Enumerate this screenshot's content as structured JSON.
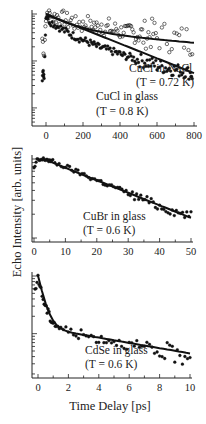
{
  "figure": {
    "ylabel": "Echo Intensity [arb. units]",
    "xlabel": "Time Delay [ps]"
  },
  "chart_data": [
    {
      "type": "scatter",
      "yscale": "log",
      "xlim": [
        -30,
        800
      ],
      "xticks": [
        0,
        200,
        400,
        600,
        800
      ],
      "xtick_labels": [
        "0",
        "200",
        "400",
        "600",
        "800"
      ],
      "grid": false,
      "annotations": [
        {
          "text": "CuCl in NaCl",
          "line2": "(T = 0.72 K)"
        },
        {
          "text": "CuCl in glass",
          "line2": "(T = 0.8 K)"
        }
      ],
      "series": [
        {
          "name": "CuCl in NaCl (T = 0.72 K)",
          "marker": "open-circle",
          "x": [
            -20,
            -10,
            0,
            10,
            20,
            40,
            60,
            80,
            100,
            120,
            140,
            160,
            180,
            200,
            220,
            240,
            260,
            280,
            300,
            320,
            340,
            360,
            380,
            400,
            420,
            440,
            460,
            480,
            500,
            520,
            540,
            560,
            580,
            600,
            640,
            680,
            720,
            760,
            790
          ],
          "y_rel": [
            0.3,
            0.16,
            1.0,
            0.98,
            0.92,
            0.85,
            0.9,
            0.75,
            0.82,
            0.68,
            0.72,
            0.6,
            0.65,
            0.55,
            0.7,
            0.52,
            0.6,
            0.5,
            0.62,
            0.45,
            0.55,
            0.42,
            0.5,
            0.4,
            0.48,
            0.38,
            0.45,
            0.36,
            0.42,
            0.33,
            0.38,
            0.35,
            0.4,
            0.32,
            0.34,
            0.3,
            0.28,
            0.29,
            0.26
          ]
        },
        {
          "name": "CuCl in glass (T = 0.8 K)",
          "marker": "filled-circle",
          "x": [
            -20,
            -15,
            -10,
            0,
            10,
            20,
            40,
            60,
            80,
            100,
            120,
            140,
            160,
            180,
            200,
            220,
            240,
            260,
            280,
            300,
            320,
            340,
            360,
            380,
            400,
            420,
            440,
            460,
            480,
            500,
            520,
            540,
            560,
            580,
            600,
            620,
            640,
            660,
            680,
            700,
            720,
            740,
            760,
            780,
            790
          ],
          "y_rel": [
            0.045,
            0.055,
            0.05,
            0.95,
            0.85,
            0.7,
            0.62,
            0.55,
            0.5,
            0.44,
            0.4,
            0.36,
            0.33,
            0.3,
            0.28,
            0.26,
            0.24,
            0.22,
            0.2,
            0.19,
            0.18,
            0.17,
            0.16,
            0.15,
            0.14,
            0.13,
            0.125,
            0.12,
            0.11,
            0.105,
            0.1,
            0.095,
            0.09,
            0.085,
            0.08,
            0.077,
            0.073,
            0.07,
            0.067,
            0.065,
            0.062,
            0.06,
            0.058,
            0.055,
            0.05
          ]
        }
      ],
      "fits": [
        {
          "name": "CuCl in NaCl fit",
          "x": [
            0,
            800
          ],
          "y_rel_start": 1.0,
          "y_rel_end": 0.26
        },
        {
          "name": "CuCl in glass fit",
          "x": [
            0,
            800
          ],
          "y_rel_start": 1.0,
          "y_rel_end": 0.055
        }
      ]
    },
    {
      "type": "scatter",
      "yscale": "log",
      "xlim": [
        0,
        50
      ],
      "xticks": [
        0,
        10,
        20,
        30,
        40,
        50
      ],
      "xtick_labels": [
        "0",
        "10",
        "20",
        "30",
        "40",
        "50"
      ],
      "grid": false,
      "annotations": [
        {
          "text": "CuBr in glass",
          "line2": "(T = 0.6 K)"
        }
      ],
      "series": [
        {
          "name": "CuBr in glass (T = 0.6 K)",
          "marker": "filled-circle",
          "x": [
            0,
            1,
            2,
            3,
            4,
            5,
            6,
            8,
            10,
            12,
            14,
            16,
            18,
            20,
            22,
            24,
            26,
            28,
            30,
            32,
            34,
            36,
            38,
            40,
            42,
            44,
            46,
            48,
            50
          ],
          "y_rel": [
            0.75,
            0.95,
            0.97,
            0.98,
            1.0,
            0.95,
            0.92,
            0.85,
            0.8,
            0.74,
            0.68,
            0.63,
            0.58,
            0.54,
            0.5,
            0.46,
            0.44,
            0.4,
            0.37,
            0.34,
            0.32,
            0.3,
            0.27,
            0.25,
            0.235,
            0.22,
            0.21,
            0.2,
            0.19
          ]
        }
      ],
      "fits": [
        {
          "name": "CuBr in glass fit",
          "x": [
            3,
            50
          ],
          "y_rel_start": 1.0,
          "y_rel_end": 0.18
        }
      ]
    },
    {
      "type": "scatter",
      "yscale": "log",
      "xlim": [
        -0.5,
        10
      ],
      "xticks": [
        0,
        2,
        4,
        6,
        8,
        10
      ],
      "xtick_labels": [
        "0",
        "2",
        "4",
        "6",
        "8",
        "10"
      ],
      "grid": false,
      "annotations": [
        {
          "text": "CdSe in glass",
          "line2": "(T = 0.6 K)"
        }
      ],
      "series": [
        {
          "name": "CdSe in glass (T = 0.6 K)",
          "marker": "filled-circle",
          "x": [
            -0.2,
            0,
            0.2,
            0.4,
            0.6,
            0.8,
            1.0,
            1.2,
            1.5,
            2.0,
            2.5,
            3.0,
            3.5,
            4.0,
            4.5,
            5.0,
            5.5,
            6.0,
            6.5,
            7.0,
            7.5,
            8.0,
            8.5,
            9.0,
            9.5,
            10.0
          ],
          "y_rel": [
            0.5,
            1.0,
            0.55,
            0.35,
            0.25,
            0.19,
            0.16,
            0.14,
            0.125,
            0.11,
            0.1,
            0.095,
            0.088,
            0.082,
            0.078,
            0.075,
            0.068,
            0.062,
            0.058,
            0.052,
            0.05,
            0.045,
            0.05,
            0.042,
            0.04,
            0.045
          ]
        }
      ],
      "fits": [
        {
          "name": "CdSe in glass fit",
          "x": [
            0,
            10
          ],
          "shape": "bi-exponential"
        }
      ]
    }
  ]
}
